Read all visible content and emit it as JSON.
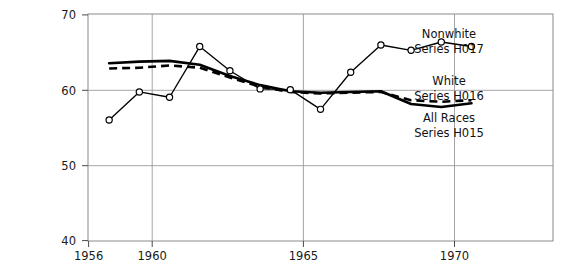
{
  "chart_data": {
    "type": "line",
    "title": "",
    "subtitle": "",
    "xlabel": "",
    "ylabel": "",
    "xlim": [
      1955.3,
      1970.7
    ],
    "ylim": [
      40,
      70
    ],
    "x_ticks": [
      1956,
      1960,
      1965,
      1970
    ],
    "x_tick_labels": [
      "1956",
      "1960",
      "1965",
      "1970"
    ],
    "y_ticks": [
      40,
      50,
      60,
      70
    ],
    "y_tick_labels": [
      "40",
      "50",
      "60",
      "70"
    ],
    "grid": "horizontal gridlines at 50 and 60; vertical gridlines at 1960 and 1965",
    "legend_position": "inside plot, right side, label blocks next to series ends",
    "x": [
      1956,
      1957,
      1958,
      1959,
      1960,
      1961,
      1962,
      1963,
      1964,
      1965,
      1966,
      1967,
      1968
    ],
    "series": [
      {
        "name": "Nonwhite",
        "series_code": "Series H017",
        "style": "solid thin line with open circle markers",
        "values": [
          56.0,
          59.7,
          59.0,
          65.7,
          62.5,
          60.1,
          60.0,
          57.4,
          62.3,
          65.9,
          65.2,
          66.3,
          65.7
        ]
      },
      {
        "name": "All Races",
        "series_code": "Series H015",
        "style": "solid heavy line, no markers",
        "values": [
          63.5,
          63.7,
          63.8,
          63.3,
          61.8,
          60.6,
          59.8,
          59.6,
          59.7,
          59.8,
          58.1,
          57.7,
          58.2
        ]
      },
      {
        "name": "White",
        "series_code": "Series H016",
        "style": "dashed heavy line, no markers",
        "values": [
          62.8,
          62.9,
          63.2,
          62.9,
          61.6,
          60.4,
          59.7,
          59.5,
          59.6,
          59.7,
          58.6,
          58.4,
          58.6
        ]
      }
    ],
    "annotations": [
      {
        "id": "nonwhite",
        "line1": "Nonwhite",
        "line2": "Series H017"
      },
      {
        "id": "white",
        "line1": "White",
        "line2": "Series H016"
      },
      {
        "id": "allraces",
        "line1": "All Races",
        "line2": "Series H015"
      }
    ]
  },
  "axes": {
    "y_labels": [
      "70",
      "60",
      "50",
      "40"
    ],
    "x_labels": [
      "1956",
      "1960",
      "1965",
      "1970"
    ]
  },
  "legend": {
    "nonwhite_name": "Nonwhite",
    "nonwhite_code": "Series H017",
    "white_name": "White",
    "white_code": "Series H016",
    "allraces_name": "All Races",
    "allraces_code": "Series H015"
  },
  "colors": {
    "line": "#000000",
    "frame": "#8a8a8a",
    "grid": "#9a9a9a",
    "background": "#ffffff",
    "text": "#1a1a1a"
  }
}
